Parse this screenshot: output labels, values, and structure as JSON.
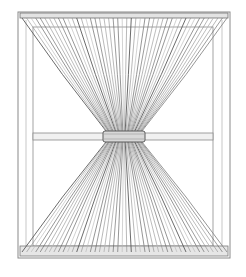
{
  "image": {
    "subject": "Pencil sketch of a window with a sheer curtain gathered and tied at the center",
    "colors": {
      "background": "#ffffff",
      "pencil_dark": "#5a5a5a",
      "pencil_mid": "#8a8a8a",
      "pencil_light": "#b5b5b5",
      "band_fill": "#d8d8d8"
    },
    "elements": [
      "window-frame-outer",
      "window-frame-inner",
      "window-crossbar",
      "curtain-rod",
      "curtain-upper-fan",
      "curtain-lower-fan",
      "curtain-tie-band",
      "window-sill"
    ]
  }
}
